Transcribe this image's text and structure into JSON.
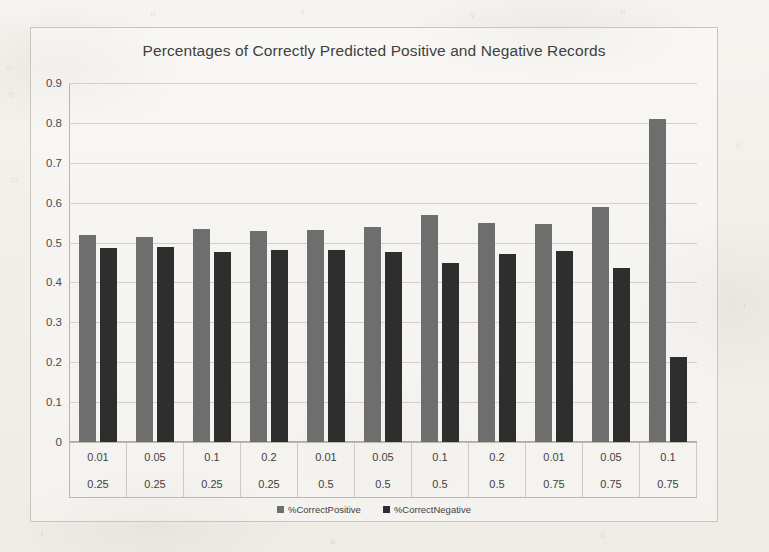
{
  "chart_data": {
    "type": "bar",
    "title": "Percentages of Correctly Predicted Positive and Negative Records",
    "xlabel": "",
    "ylabel": "",
    "ylim": [
      0,
      0.9
    ],
    "grid": true,
    "legend_position": "bottom",
    "y_ticks": [
      "0.9",
      "0.8",
      "0.7",
      "0.6",
      "0.5",
      "0.4",
      "0.3",
      "0.2",
      "0.1",
      "0"
    ],
    "y_tick_values": [
      0.9,
      0.8,
      0.7,
      0.6,
      0.5,
      0.4,
      0.3,
      0.2,
      0.1,
      0
    ],
    "category_rows": [
      [
        "0.01",
        "0.05",
        "0.1",
        "0.2",
        "0.01",
        "0.05",
        "0.1",
        "0.2",
        "0.01",
        "0.05",
        "0.1"
      ],
      [
        "0.25",
        "0.25",
        "0.25",
        "0.25",
        "0.5",
        "0.5",
        "0.5",
        "0.5",
        "0.75",
        "0.75",
        "0.75"
      ]
    ],
    "categories": [
      "0.01 / 0.25",
      "0.05 / 0.25",
      "0.1 / 0.25",
      "0.2 / 0.25",
      "0.01 / 0.5",
      "0.05 / 0.5",
      "0.1 / 0.5",
      "0.2 / 0.5",
      "0.01 / 0.75",
      "0.05 / 0.75",
      "0.1 / 0.75"
    ],
    "series": [
      {
        "name": "%CorrectPositive",
        "color": "#6e6e6e",
        "values": [
          0.52,
          0.515,
          0.535,
          0.528,
          0.532,
          0.54,
          0.57,
          0.548,
          0.547,
          0.59,
          0.81
        ]
      },
      {
        "name": "%CorrectNegative",
        "color": "#2e2e2e",
        "values": [
          0.487,
          0.49,
          0.477,
          0.482,
          0.482,
          0.477,
          0.45,
          0.472,
          0.48,
          0.437,
          0.212
        ]
      }
    ]
  },
  "ghost_marks": [
    {
      "text": "o",
      "left": 6,
      "top": 62
    },
    {
      "text": "0",
      "left": 8,
      "top": 90
    },
    {
      "text": "III",
      "left": 10,
      "top": 175
    },
    {
      "text": "u",
      "left": 150,
      "top": 8
    },
    {
      "text": "s",
      "left": 300,
      "top": 6
    },
    {
      "text": "v",
      "left": 470,
      "top": 10
    },
    {
      "text": "n",
      "left": 620,
      "top": 7
    },
    {
      "text": "e",
      "left": 735,
      "top": 140
    },
    {
      "text": "r",
      "left": 742,
      "top": 300
    },
    {
      "text": "t",
      "left": 40,
      "top": 528
    },
    {
      "text": "a",
      "left": 330,
      "top": 536
    },
    {
      "text": "o",
      "left": 600,
      "top": 530
    }
  ]
}
